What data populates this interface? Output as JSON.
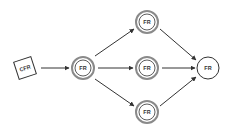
{
  "diagram": {
    "colors": {
      "stroke": "#333333",
      "double_ring": "#8a8a8a",
      "background": "#ffffff"
    },
    "nodes": [
      {
        "id": "cfr",
        "label": "CFR",
        "shape": "rotated-square",
        "x": 25,
        "y": 68
      },
      {
        "id": "fr_left",
        "label": "FR",
        "shape": "double-circle",
        "x": 83,
        "y": 68
      },
      {
        "id": "fr_top",
        "label": "FR",
        "shape": "double-circle",
        "x": 147,
        "y": 22
      },
      {
        "id": "fr_mid",
        "label": "FR",
        "shape": "double-circle",
        "x": 147,
        "y": 68
      },
      {
        "id": "fr_bottom",
        "label": "FR",
        "shape": "double-circle",
        "x": 147,
        "y": 112
      },
      {
        "id": "fr_right",
        "label": "FR",
        "shape": "circle",
        "x": 208,
        "y": 68
      }
    ],
    "edges": [
      {
        "from": "cfr",
        "to": "fr_left"
      },
      {
        "from": "fr_left",
        "to": "fr_top"
      },
      {
        "from": "fr_left",
        "to": "fr_mid"
      },
      {
        "from": "fr_left",
        "to": "fr_bottom"
      },
      {
        "from": "fr_top",
        "to": "fr_right"
      },
      {
        "from": "fr_mid",
        "to": "fr_right"
      },
      {
        "from": "fr_bottom",
        "to": "fr_right"
      }
    ]
  }
}
